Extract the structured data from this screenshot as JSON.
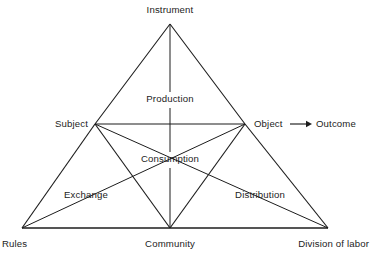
{
  "figure": {
    "background_color": "#ffffff",
    "line_color": "#1c1c1c"
  },
  "nodes": {
    "instrument": {
      "label": "Instrument",
      "x": 170,
      "y": 24,
      "label_x": 170,
      "label_y": 13
    },
    "subject": {
      "label": "Subject",
      "x": 95,
      "y": 124,
      "label_x": 88,
      "label_y": 127
    },
    "object": {
      "label": "Object",
      "x": 245,
      "y": 124,
      "label_x": 254,
      "label_y": 127
    },
    "outcome": {
      "label": "Outcome",
      "x": 316,
      "y": 124,
      "label_x": 316,
      "label_y": 127
    },
    "rules": {
      "label": "Rules",
      "x": 22,
      "y": 228,
      "label_x": 2,
      "label_y": 247
    },
    "community": {
      "label": "Community",
      "x": 170,
      "y": 228,
      "label_x": 170,
      "label_y": 247
    },
    "division_of_labor": {
      "label": "Division of labor",
      "x": 328,
      "y": 228,
      "label_x": 369,
      "label_y": 247
    }
  },
  "inner_labels": {
    "production": {
      "label": "Production",
      "x": 170,
      "y": 102
    },
    "consumption": {
      "label": "Consumption",
      "x": 170,
      "y": 162
    },
    "exchange": {
      "label": "Exchange",
      "x": 86,
      "y": 198
    },
    "distribution": {
      "label": "Distribution",
      "x": 260,
      "y": 198
    }
  },
  "arrow": {
    "name": "object-to-outcome-arrow",
    "x1": 290,
    "y1": 124,
    "x2": 312,
    "y2": 124
  },
  "edges": [
    {
      "name": "instrument-to-subject",
      "x1": 170,
      "y1": 24,
      "x2": 95,
      "y2": 124
    },
    {
      "name": "instrument-to-object",
      "x1": 170,
      "y1": 24,
      "x2": 245,
      "y2": 124
    },
    {
      "name": "subject-to-rules",
      "x1": 95,
      "y1": 124,
      "x2": 22,
      "y2": 228
    },
    {
      "name": "object-to-division",
      "x1": 245,
      "y1": 124,
      "x2": 328,
      "y2": 228
    },
    {
      "name": "subject-to-object",
      "x1": 95,
      "y1": 124,
      "x2": 245,
      "y2": 124
    },
    {
      "name": "subject-to-community",
      "x1": 95,
      "y1": 124,
      "x2": 170,
      "y2": 228
    },
    {
      "name": "object-to-community",
      "x1": 245,
      "y1": 124,
      "x2": 170,
      "y2": 228
    },
    {
      "name": "rules-to-object",
      "x1": 22,
      "y1": 228,
      "x2": 245,
      "y2": 124
    },
    {
      "name": "division-to-subject",
      "x1": 328,
      "y1": 228,
      "x2": 95,
      "y2": 124
    }
  ],
  "base_edge": {
    "name": "rules-to-division-baseline",
    "x1": 22,
    "y1": 228,
    "x2": 328,
    "y2": 228
  },
  "vertical_segments": [
    {
      "name": "instrument-to-production-segment",
      "x1": 170,
      "y1": 24,
      "x2": 170,
      "y2": 92
    },
    {
      "name": "production-to-consumption-segment",
      "x1": 170,
      "y1": 108,
      "x2": 170,
      "y2": 152
    },
    {
      "name": "consumption-to-community-segment",
      "x1": 170,
      "y1": 168,
      "x2": 170,
      "y2": 228
    }
  ]
}
